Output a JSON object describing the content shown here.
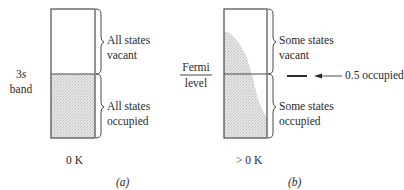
{
  "panel_a": {
    "band_label_line1": "3s",
    "band_label_line2": "band",
    "upper_label_line1": "All states",
    "upper_label_line2": "vacant",
    "lower_label_line1": "All states",
    "lower_label_line2": "occupied",
    "temperature": "0 K",
    "caption": "(a)"
  },
  "panel_b": {
    "fermi_label_line1": "Fermi",
    "fermi_label_line2": "level",
    "upper_label_line1": "Some states",
    "upper_label_line2": "vacant",
    "lower_label_line1": "Some states",
    "lower_label_line2": "occupied",
    "annotation": "0.5 occupied",
    "temperature": "> 0 K",
    "caption": "(b)"
  },
  "colors": {
    "line": "#4a4a4a",
    "shade": "#dcdcdc"
  }
}
